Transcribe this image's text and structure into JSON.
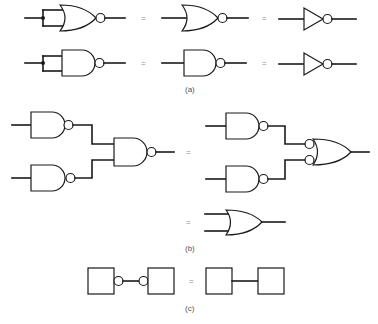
{
  "figure": {
    "panels": [
      {
        "id": "a",
        "caption": "(a)",
        "rows": [
          {
            "description": "NOR gate with tied inputs equals inverted-input OR form equals NOT gate",
            "items": [
              "NOR gate (inputs tied)",
              "=",
              "NOR gate",
              "=",
              "NOT gate"
            ]
          },
          {
            "description": "NAND gate with tied inputs equals NAND gate equals NOT gate",
            "items": [
              "NAND gate (inputs tied)",
              "=",
              "NAND gate",
              "=",
              "NOT gate"
            ]
          }
        ]
      },
      {
        "id": "b",
        "caption": "(b)",
        "description": "Two NAND gates feeding a NAND gate equals two NAND gates feeding an OR gate with inverted inputs equals an OR gate",
        "items": [
          "NAND-NAND network",
          "=",
          "NAND into bubbled OR",
          "=",
          "OR gate"
        ]
      },
      {
        "id": "c",
        "caption": "(c)",
        "description": "Two blocks connected through double inversion bubbles equals two blocks directly connected",
        "items": [
          "block - bubble - bubble - block",
          "=",
          "block - block"
        ]
      }
    ],
    "equals_sign": "=",
    "colors": {
      "line": "#1a1a1a",
      "background": "#ffffff",
      "equals": "#888888",
      "caption": "#555555"
    }
  }
}
